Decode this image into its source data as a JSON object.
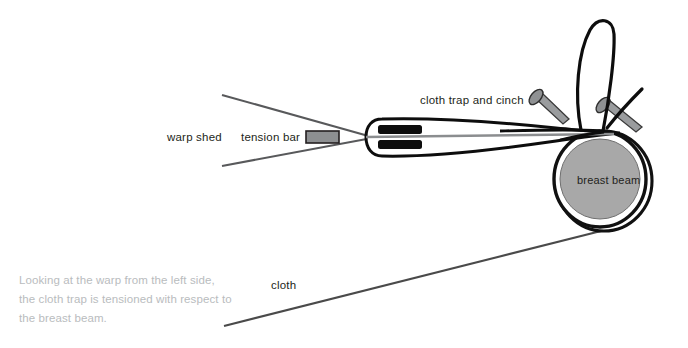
{
  "figure": {
    "background_color": "#ffffff",
    "labels": {
      "warp_shed": "warp shed",
      "tension_bar": "tension bar",
      "cloth_trap_and_cinch": "cloth trap and cinch",
      "breast_beam": "breast beam",
      "cloth": "cloth"
    },
    "caption": "Looking at the warp from the left side, the cloth trap is tensioned with respect to the breast beam.",
    "colors": {
      "ink": "#231f20",
      "line": "#3b3b3b",
      "gray_fill": "#a8a8a8",
      "caption_gray": "#b9bcbe",
      "warp_line": "#58595b",
      "white": "#ffffff"
    },
    "parts": {
      "tension_bar_shape": "gray-rectangle-with-dark-outline",
      "cloth_trap_shape": "tapered-leaf-outline-with-two-black-bars",
      "breast_beam_shape": "gray-filled-circle-with-double-black-ring",
      "cinch_shape": "looped-cord-over-two-nails",
      "nail_count": 2,
      "trap_bar_count": 2
    }
  }
}
